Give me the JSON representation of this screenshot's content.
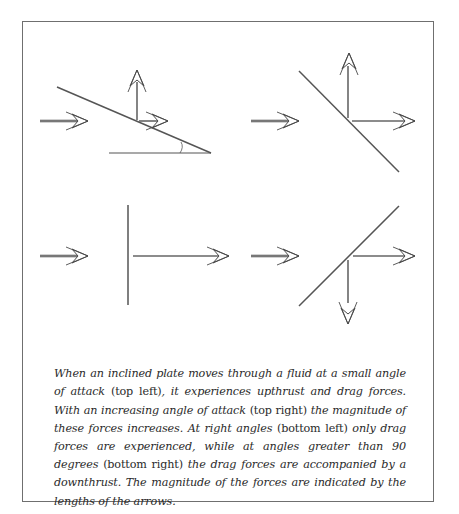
{
  "figure": {
    "panels": [
      {
        "id": "top-left",
        "description": "Inclined plate at small angle of attack",
        "forces": [
          "flow",
          "upthrust",
          "drag"
        ]
      },
      {
        "id": "top-right",
        "description": "Inclined plate at increased angle of attack",
        "forces": [
          "flow",
          "upthrust",
          "drag"
        ]
      },
      {
        "id": "bottom-left",
        "description": "Plate at right angles to flow",
        "forces": [
          "flow",
          "drag"
        ]
      },
      {
        "id": "bottom-right",
        "description": "Plate at angle greater than 90 degrees",
        "forces": [
          "flow",
          "drag",
          "downthrust"
        ]
      }
    ]
  },
  "caption": {
    "s1": "When an inclined plate moves through a fluid at a small angle of attack ",
    "p1": "(top left)",
    "s2": ", it experiences upthrust and drag forces. With an increasing angle of attack ",
    "p2": "(top right)",
    "s3": " the magnitude of these forces increases. At right angles ",
    "p3": "(bottom left)",
    "s4": " only drag forces are experienced, while at angles greater than 90 degrees ",
    "p4": "(bottom right)",
    "s5": " the drag forces are accompanied by a downthrust. The magnitude of the forces are indicated by the lengths of the arrows."
  },
  "colors": {
    "line": "#555555",
    "border": "#6f6f6f",
    "text": "#2a2a2a"
  }
}
